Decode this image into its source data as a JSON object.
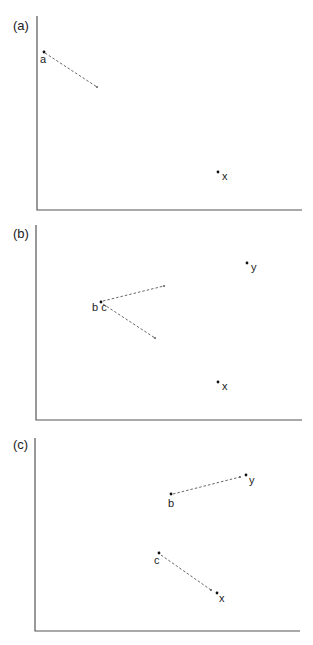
{
  "panels": [
    {
      "id": "a",
      "label": "(a)",
      "points": [
        {
          "name": "a",
          "label": "a",
          "x": 44,
          "y": 52,
          "lx": 40,
          "ly": 63
        },
        {
          "name": "x",
          "label": "x",
          "x": 218,
          "y": 172,
          "lx": 222,
          "ly": 180
        }
      ],
      "arrows": [
        {
          "from": [
            45,
            53
          ],
          "to": [
            97,
            87
          ]
        }
      ]
    },
    {
      "id": "b",
      "label": "(b)",
      "points": [
        {
          "name": "bc",
          "label": "b c",
          "x": 101,
          "y": 302,
          "lx": 92,
          "ly": 311
        },
        {
          "name": "y",
          "label": "y",
          "x": 247,
          "y": 263,
          "lx": 251,
          "ly": 271
        },
        {
          "name": "x",
          "label": "x",
          "x": 218,
          "y": 382,
          "lx": 222,
          "ly": 390
        }
      ],
      "arrows": [
        {
          "from": [
            103,
            301
          ],
          "to": [
            164,
            286
          ]
        },
        {
          "from": [
            103,
            304
          ],
          "to": [
            155,
            338
          ]
        }
      ]
    },
    {
      "id": "c",
      "label": "(c)",
      "points": [
        {
          "name": "b",
          "label": "b",
          "x": 171,
          "y": 494,
          "lx": 168,
          "ly": 507
        },
        {
          "name": "y",
          "label": "y",
          "x": 246,
          "y": 475,
          "lx": 249,
          "ly": 484
        },
        {
          "name": "c",
          "label": "c",
          "x": 159,
          "y": 553,
          "lx": 154,
          "ly": 564
        },
        {
          "name": "x",
          "label": "x",
          "x": 217,
          "y": 593,
          "lx": 219,
          "ly": 602
        }
      ],
      "arrows": [
        {
          "from": [
            173,
            494
          ],
          "to": [
            240,
            477
          ]
        },
        {
          "from": [
            161,
            555
          ],
          "to": [
            211,
            590
          ]
        }
      ]
    }
  ]
}
